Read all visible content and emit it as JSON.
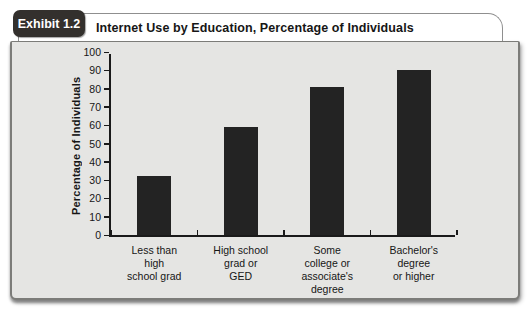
{
  "header": {
    "badge_label": "Exhibit 1.2",
    "title": "Internet Use by Education, Percentage of Individuals"
  },
  "colors": {
    "bar": "#232323",
    "plot_background": "#e5e5e3",
    "badge_background": "#33302d",
    "axis": "#1a1a1a"
  },
  "chart_data": {
    "type": "bar",
    "title": "Internet Use by Education, Percentage of Individuals",
    "categories": [
      "Less than\nhigh\nschool grad",
      "High school\ngrad or\nGED",
      "Some\ncollege or\nassociate's\ndegree",
      "Bachelor's\ndegree\nor higher"
    ],
    "values": [
      32,
      59,
      81,
      90
    ],
    "xlabel": "",
    "ylabel": "Percentage of Individuals",
    "ylim": [
      0,
      100
    ],
    "ytick_step": 10,
    "grid": false,
    "legend": "none",
    "bar_width_px": 34
  }
}
